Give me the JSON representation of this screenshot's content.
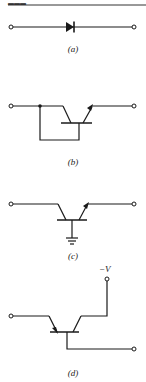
{
  "header": {
    "page_fragment": "▬▬▬"
  },
  "figures": [
    {
      "id": "a",
      "label": "(a)",
      "component": "diode"
    },
    {
      "id": "b",
      "label": "(b)",
      "component": "transistor-diode-connected"
    },
    {
      "id": "c",
      "label": "(c)",
      "component": "transistor-grounded-base"
    },
    {
      "id": "d",
      "label": "(d)",
      "component": "transistor-with-supply",
      "supply_label": "−V"
    }
  ]
}
